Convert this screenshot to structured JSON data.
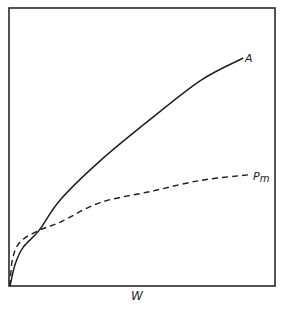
{
  "chart_data": {
    "type": "line",
    "title": "",
    "xlabel": "W",
    "ylabel": "",
    "grid": false,
    "legend": "inline labels at line ends",
    "xlim": [
      0,
      1
    ],
    "ylim": [
      0,
      1
    ],
    "tick_labels": {
      "x": [],
      "y": []
    },
    "series": [
      {
        "name": "A",
        "style": "solid",
        "x": [
          0.0,
          0.02,
          0.05,
          0.11,
          0.19,
          0.34,
          0.53,
          0.72,
          0.88
        ],
        "y": [
          0.0,
          0.08,
          0.14,
          0.2,
          0.31,
          0.45,
          0.6,
          0.74,
          0.82
        ]
      },
      {
        "name": "Pm",
        "style": "dashed",
        "x": [
          0.0,
          0.01,
          0.04,
          0.11,
          0.19,
          0.34,
          0.53,
          0.72,
          0.9
        ],
        "y": [
          0.0,
          0.1,
          0.16,
          0.2,
          0.23,
          0.3,
          0.34,
          0.38,
          0.4
        ]
      }
    ],
    "annotations": [
      {
        "text": "A",
        "at": "end of solid curve"
      },
      {
        "text": "Pm",
        "at": "end of dashed curve"
      },
      {
        "text": "curves intersect",
        "x": 0.11,
        "y": 0.2
      }
    ]
  },
  "labels": {
    "x_axis": "W",
    "series_a": "A",
    "series_pm_main": "P",
    "series_pm_sub": "m"
  }
}
